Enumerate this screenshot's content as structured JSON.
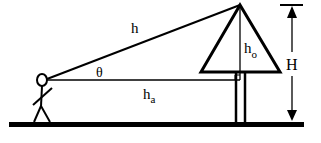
{
  "diagram": {
    "labels": {
      "hypotenuse": "h",
      "angle": "θ",
      "adjacent_main": "h",
      "adjacent_sub": "a",
      "opposite_main": "h",
      "opposite_sub": "o",
      "total_height": "H"
    },
    "colors": {
      "stroke": "#000000",
      "background": "#ffffff"
    }
  }
}
